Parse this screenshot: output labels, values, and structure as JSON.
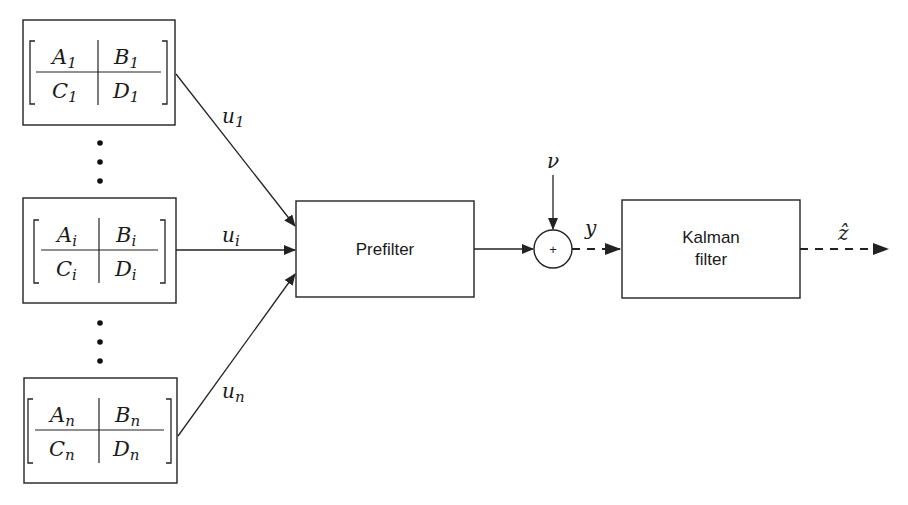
{
  "diagram": {
    "type": "block-diagram",
    "colors": {
      "stroke": "#222222",
      "background": "#ffffff"
    },
    "systems": [
      {
        "id": "system-1",
        "A": "A",
        "B": "B",
        "C": "C",
        "D": "D",
        "subscript": "1",
        "output": "u",
        "output_sub": "1"
      },
      {
        "id": "system-i",
        "A": "A",
        "B": "B",
        "C": "C",
        "D": "D",
        "subscript": "i",
        "output": "u",
        "output_sub": "i"
      },
      {
        "id": "system-n",
        "A": "A",
        "B": "B",
        "C": "C",
        "D": "D",
        "subscript": "n",
        "output": "u",
        "output_sub": "n"
      }
    ],
    "ellipsis": "⋮",
    "prefilter": {
      "label": "Prefilter"
    },
    "summing_junction": {
      "symbol": "+",
      "noise_input": "ν"
    },
    "measurement": {
      "label": "y"
    },
    "kalman": {
      "line1": "Kalman",
      "line2": "filter"
    },
    "estimate": {
      "label": "ẑ"
    }
  }
}
